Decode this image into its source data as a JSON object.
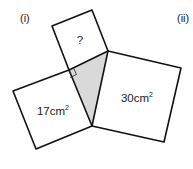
{
  "labels": {
    "part_i": "(i)",
    "part_ii": "(ii)"
  },
  "squares": {
    "top": {
      "label": "?"
    },
    "left": {
      "value": "17",
      "unit": "cm",
      "exp": "2"
    },
    "right": {
      "value": "30",
      "unit": "cm",
      "exp": "2"
    }
  },
  "colors": {
    "stroke": "#111111",
    "triangle_fill": "#d9d9d9"
  }
}
